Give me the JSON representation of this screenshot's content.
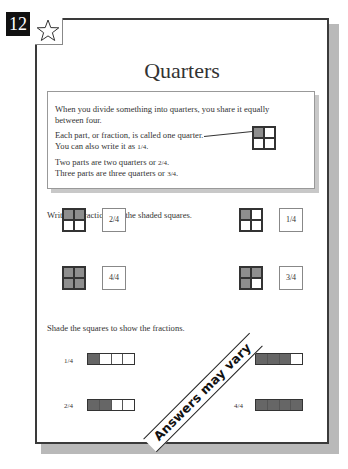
{
  "page": {
    "number": "12",
    "star_icon": "star-outline-icon",
    "title": "Quarters"
  },
  "info_box": {
    "line1": "When you divide something into quarters, you share it equally",
    "line2": "between four.",
    "line3": "Each part, or fraction, is called one quarter.",
    "line4_prefix": "You can also write it as ",
    "line4_fraction": "1/4",
    "line4_suffix": ".",
    "line5_prefix": "Two parts are two quarters or ",
    "line5_fraction": "2/4",
    "line5_suffix": ".",
    "line6_prefix": "Three parts are three quarters or ",
    "line6_fraction": "3/4",
    "line6_suffix": ".",
    "diagram": {
      "shaded": [
        true,
        false,
        false,
        false
      ]
    }
  },
  "section1": {
    "instruction": "Write the fractions for the shaded squares.",
    "items": [
      {
        "shaded": [
          true,
          true,
          false,
          false
        ],
        "answer": "2/4"
      },
      {
        "shaded": [
          true,
          false,
          false,
          false
        ],
        "answer": "1/4"
      },
      {
        "shaded": [
          true,
          true,
          true,
          true
        ],
        "answer": "4/4"
      },
      {
        "shaded": [
          true,
          true,
          true,
          false
        ],
        "answer": "3/4"
      }
    ]
  },
  "section2": {
    "instruction": "Shade the squares to show the fractions.",
    "items": [
      {
        "label": "1/4",
        "shaded": [
          true,
          false,
          false,
          false
        ]
      },
      {
        "label": "3/4",
        "shaded": [
          true,
          true,
          true,
          false
        ]
      },
      {
        "label": "2/4",
        "shaded": [
          true,
          true,
          false,
          false
        ]
      },
      {
        "label": "4/4",
        "shaded": [
          true,
          true,
          true,
          true
        ]
      }
    ],
    "stamp": "Answers may vary"
  },
  "colors": {
    "shade_grid": "#8e8e8e",
    "shade_strip": "#666666",
    "badge_bg": "#111111",
    "page_border": "#3a3a3a",
    "shadow": "#b9b9b9"
  }
}
